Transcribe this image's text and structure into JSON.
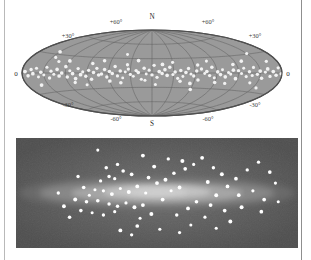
{
  "figure": {
    "type": "two-panel-astronomy-diagram"
  },
  "sky_map": {
    "projection": "aitoff",
    "pole_north_label": "N",
    "pole_south_label": "S",
    "edge_left_label": "0",
    "edge_right_label": "0",
    "latitude_labels": [
      {
        "text": "+30°",
        "x": 56,
        "y": 32
      },
      {
        "text": "+60°",
        "x": 104,
        "y": 18
      },
      {
        "text": "+60°",
        "x": 196,
        "y": 18
      },
      {
        "text": "+30°",
        "x": 243,
        "y": 32
      },
      {
        "text": "-30°",
        "x": 56,
        "y": 101
      },
      {
        "text": "-60°",
        "x": 104,
        "y": 115
      },
      {
        "text": "-60°",
        "x": 196,
        "y": 115
      },
      {
        "text": "-30°",
        "x": 243,
        "y": 101
      }
    ],
    "colors": {
      "disk_fill": "#9a9a9a",
      "disk_edge": "#5e5e5e",
      "graticule": "#606060",
      "cluster_dot": "#f2f2f2"
    },
    "graticule": {
      "meridian_step_deg": 30,
      "parallel_step_deg": 30
    }
  },
  "galaxy_panel": {
    "colors": {
      "background": "#545454",
      "halo_outer": "#6b6b6b",
      "disk_mid": "#8f8f8f",
      "disk_inner": "#b0b0b0",
      "bulge": "#c8c8c8",
      "cluster_dot": "#ffffff"
    },
    "view": "edge-on"
  },
  "chart_data": {
    "type": "scatter",
    "panels": [
      {
        "name": "aitoff-sky-map",
        "type": "scatter",
        "xlabel": "galactic longitude",
        "ylabel": "galactic latitude",
        "xlim": [
          -180,
          180
        ],
        "ylim": [
          -90,
          90
        ],
        "grid": true,
        "series": [
          {
            "name": "globular clusters",
            "units": "degrees (longitude, latitude)",
            "points": [
              [
                -176,
                2
              ],
              [
                -172,
                -4
              ],
              [
                -168,
                5
              ],
              [
                -165,
                -1
              ],
              [
                -161,
                7
              ],
              [
                -158,
                -6
              ],
              [
                -154,
                1
              ],
              [
                -150,
                -3
              ],
              [
                -147,
                9
              ],
              [
                -143,
                -8
              ],
              [
                -140,
                3
              ],
              [
                -136,
                -2
              ],
              [
                -132,
                6
              ],
              [
                -129,
                -5
              ],
              [
                -125,
                0
              ],
              [
                -121,
                11
              ],
              [
                -118,
                -7
              ],
              [
                -114,
                4
              ],
              [
                -110,
                -1
              ],
              [
                -107,
                -10
              ],
              [
                -103,
                8
              ],
              [
                -99,
                -3
              ],
              [
                -96,
                2
              ],
              [
                -92,
                -6
              ],
              [
                -88,
                5
              ],
              [
                -85,
                -12
              ],
              [
                -81,
                1
              ],
              [
                -77,
                9
              ],
              [
                -74,
                -4
              ],
              [
                -70,
                -2
              ],
              [
                -66,
                7
              ],
              [
                -63,
                -8
              ],
              [
                -59,
                3
              ],
              [
                -55,
                -1
              ],
              [
                -52,
                13
              ],
              [
                -48,
                -6
              ],
              [
                -44,
                4
              ],
              [
                -41,
                -10
              ],
              [
                -37,
                2
              ],
              [
                -33,
                8
              ],
              [
                -30,
                -3
              ],
              [
                -26,
                -7
              ],
              [
                -22,
                5
              ],
              [
                -19,
                1
              ],
              [
                -15,
                -13
              ],
              [
                -11,
                10
              ],
              [
                -8,
                -2
              ],
              [
                -4,
                6
              ],
              [
                0,
                -4
              ],
              [
                3,
                16
              ],
              [
                7,
                -9
              ],
              [
                10,
                3
              ],
              [
                14,
                -1
              ],
              [
                18,
                7
              ],
              [
                21,
                -5
              ],
              [
                25,
                12
              ],
              [
                29,
                -3
              ],
              [
                32,
                2
              ],
              [
                36,
                -11
              ],
              [
                40,
                5
              ],
              [
                43,
                -7
              ],
              [
                47,
                1
              ],
              [
                51,
                9
              ],
              [
                54,
                -2
              ],
              [
                58,
                -6
              ],
              [
                62,
                4
              ],
              [
                65,
                -14
              ],
              [
                69,
                8
              ],
              [
                73,
                -1
              ],
              [
                76,
                3
              ],
              [
                80,
                -5
              ],
              [
                84,
                11
              ],
              [
                87,
                -9
              ],
              [
                91,
                2
              ],
              [
                95,
                -3
              ],
              [
                98,
                6
              ],
              [
                102,
                -7
              ],
              [
                106,
                1
              ],
              [
                109,
                -2
              ],
              [
                113,
                5
              ],
              [
                117,
                -10
              ],
              [
                120,
                4
              ],
              [
                124,
                -1
              ],
              [
                128,
                8
              ],
              [
                131,
                -6
              ],
              [
                135,
                2
              ],
              [
                139,
                -4
              ],
              [
                142,
                9
              ],
              [
                146,
                -2
              ],
              [
                150,
                3
              ],
              [
                153,
                -8
              ],
              [
                157,
                1
              ],
              [
                161,
                6
              ],
              [
                164,
                -5
              ],
              [
                168,
                2
              ],
              [
                172,
                -3
              ],
              [
                176,
                7
              ],
              [
                179,
                -1
              ],
              [
                -145,
                25
              ],
              [
                -120,
                21
              ],
              [
                -95,
                -22
              ],
              [
                -70,
                24
              ],
              [
                -45,
                -20
              ],
              [
                -20,
                26
              ],
              [
                5,
                -24
              ],
              [
                30,
                22
              ],
              [
                55,
                -21
              ],
              [
                80,
                23
              ],
              [
                105,
                -19
              ],
              [
                130,
                20
              ],
              [
                155,
                -23
              ],
              [
                -160,
                -18
              ],
              [
                -135,
                19
              ],
              [
                -110,
                -17
              ],
              [
                -85,
                18
              ],
              [
                -60,
                -16
              ],
              [
                -35,
                17
              ],
              [
                -10,
                -15
              ],
              [
                15,
                18
              ],
              [
                40,
                -17
              ],
              [
                65,
                16
              ],
              [
                90,
                -18
              ],
              [
                115,
                15
              ],
              [
                140,
                -16
              ],
              [
                165,
                17
              ],
              [
                -150,
                34
              ],
              [
                -40,
                38
              ],
              [
                60,
                -33
              ],
              [
                150,
                31
              ]
            ]
          }
        ]
      },
      {
        "name": "edge-on-galaxy",
        "type": "scatter",
        "xlabel": "distance along galactic plane",
        "ylabel": "height above plane",
        "grid": false,
        "series": [
          {
            "name": "globular clusters (halo)",
            "units": "panel fraction (x 0-1, y 0-1 top to bottom)",
            "points": [
              [
                0.29,
                0.11
              ],
              [
                0.36,
                0.24
              ],
              [
                0.38,
                0.3
              ],
              [
                0.41,
                0.33
              ],
              [
                0.33,
                0.35
              ],
              [
                0.35,
                0.37
              ],
              [
                0.3,
                0.39
              ],
              [
                0.24,
                0.45
              ],
              [
                0.28,
                0.47
              ],
              [
                0.31,
                0.48
              ],
              [
                0.26,
                0.52
              ],
              [
                0.34,
                0.51
              ],
              [
                0.37,
                0.46
              ],
              [
                0.4,
                0.49
              ],
              [
                0.43,
                0.44
              ],
              [
                0.46,
                0.5
              ],
              [
                0.21,
                0.56
              ],
              [
                0.25,
                0.58
              ],
              [
                0.29,
                0.57
              ],
              [
                0.33,
                0.6
              ],
              [
                0.36,
                0.62
              ],
              [
                0.39,
                0.59
              ],
              [
                0.42,
                0.63
              ],
              [
                0.45,
                0.61
              ],
              [
                0.23,
                0.66
              ],
              [
                0.27,
                0.68
              ],
              [
                0.31,
                0.7
              ],
              [
                0.35,
                0.67
              ],
              [
                0.19,
                0.72
              ],
              [
                0.44,
                0.73
              ],
              [
                0.48,
                0.69
              ],
              [
                0.52,
                0.56
              ],
              [
                0.55,
                0.48
              ],
              [
                0.58,
                0.45
              ],
              [
                0.5,
                0.41
              ],
              [
                0.53,
                0.38
              ],
              [
                0.47,
                0.36
              ],
              [
                0.56,
                0.32
              ],
              [
                0.6,
                0.28
              ],
              [
                0.63,
                0.24
              ],
              [
                0.59,
                0.21
              ],
              [
                0.66,
                0.18
              ],
              [
                0.7,
                0.27
              ],
              [
                0.73,
                0.33
              ],
              [
                0.68,
                0.4
              ],
              [
                0.75,
                0.44
              ],
              [
                0.71,
                0.52
              ],
              [
                0.64,
                0.58
              ],
              [
                0.61,
                0.64
              ],
              [
                0.57,
                0.7
              ],
              [
                0.67,
                0.72
              ],
              [
                0.74,
                0.66
              ],
              [
                0.78,
                0.37
              ],
              [
                0.82,
                0.29
              ],
              [
                0.86,
                0.22
              ],
              [
                0.9,
                0.31
              ],
              [
                0.84,
                0.48
              ],
              [
                0.88,
                0.56
              ],
              [
                0.8,
                0.63
              ],
              [
                0.76,
                0.76
              ],
              [
                0.62,
                0.79
              ],
              [
                0.51,
                0.83
              ],
              [
                0.43,
                0.8
              ],
              [
                0.37,
                0.84
              ],
              [
                0.92,
                0.41
              ],
              [
                0.17,
                0.62
              ],
              [
                0.15,
                0.5
              ],
              [
                0.22,
                0.35
              ],
              [
                0.49,
                0.26
              ],
              [
                0.54,
                0.19
              ],
              [
                0.45,
                0.16
              ],
              [
                0.69,
                0.61
              ],
              [
                0.79,
                0.52
              ],
              [
                0.87,
                0.67
              ],
              [
                0.93,
                0.58
              ],
              [
                0.32,
                0.27
              ],
              [
                0.41,
                0.88
              ],
              [
                0.58,
                0.86
              ],
              [
                0.71,
                0.82
              ]
            ]
          }
        ]
      }
    ]
  }
}
